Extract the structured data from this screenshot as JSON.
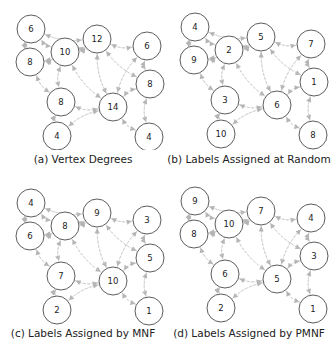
{
  "figure": {
    "nodes": [
      "A",
      "B",
      "C",
      "D",
      "E",
      "F",
      "G",
      "H",
      "I",
      "J"
    ],
    "edges": [
      [
        "A",
        "B"
      ],
      [
        "A",
        "C"
      ],
      [
        "A",
        "D"
      ],
      [
        "B",
        "C"
      ],
      [
        "B",
        "G"
      ],
      [
        "B",
        "D"
      ],
      [
        "C",
        "D"
      ],
      [
        "C",
        "G"
      ],
      [
        "C",
        "H"
      ],
      [
        "D",
        "E"
      ],
      [
        "D",
        "H"
      ],
      [
        "D",
        "F"
      ],
      [
        "E",
        "F"
      ],
      [
        "E",
        "H"
      ],
      [
        "F",
        "H"
      ],
      [
        "F",
        "J"
      ],
      [
        "G",
        "H"
      ],
      [
        "G",
        "I"
      ],
      [
        "H",
        "I"
      ],
      [
        "H",
        "J"
      ]
    ],
    "colors": {
      "node_stroke": "#333333",
      "node_fill": "#ffffff",
      "edge": "#c8c8c8",
      "arrow": "#b4b4b4",
      "text": "#222222"
    },
    "panels": [
      {
        "caption": "(a) Vertex Degrees",
        "labels": {
          "A": "6",
          "B": "8",
          "C": "10",
          "D": "12",
          "E": "6",
          "F": "8",
          "G": "8",
          "H": "14",
          "I": "4",
          "J": "4"
        }
      },
      {
        "caption": "(b) Labels Assigned at Random",
        "labels": {
          "A": "4",
          "B": "9",
          "C": "2",
          "D": "5",
          "E": "7",
          "F": "1",
          "G": "3",
          "H": "6",
          "I": "10",
          "J": "8"
        }
      },
      {
        "caption": "(c) Labels Assigned by MNF",
        "labels": {
          "A": "4",
          "B": "6",
          "C": "8",
          "D": "9",
          "E": "3",
          "F": "5",
          "G": "7",
          "H": "10",
          "I": "2",
          "J": "1"
        }
      },
      {
        "caption": "(d) Labels Assigned by PMNF",
        "labels": {
          "A": "9",
          "B": "8",
          "C": "10",
          "D": "7",
          "E": "4",
          "F": "3",
          "G": "6",
          "H": "5",
          "I": "2",
          "J": "1"
        }
      }
    ]
  }
}
